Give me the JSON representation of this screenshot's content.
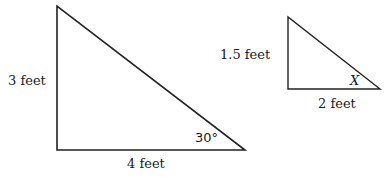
{
  "large_triangle": {
    "vertical_side_label": "3 feet",
    "horizontal_side_label": "4 feet",
    "angle_label": "30°"
  },
  "small_triangle": {
    "vertical_side_label": "1.5 feet",
    "horizontal_side_label": "2 feet",
    "angle_label": "X"
  },
  "colors": {
    "stroke": "#222222",
    "text": "#1a1a1a",
    "background": "#ffffff"
  }
}
